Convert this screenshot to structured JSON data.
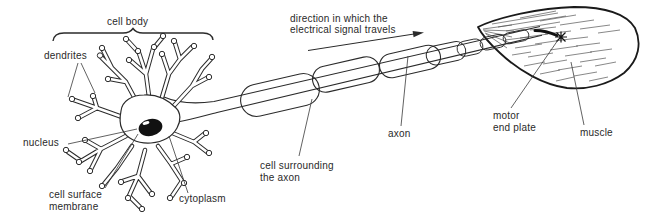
{
  "diagram": {
    "labels": {
      "cell_body": "cell body",
      "dendrites": "dendrites",
      "nucleus": "nucleus",
      "cell_surface_membrane_1": "cell surface",
      "cell_surface_membrane_2": "membrane",
      "cytoplasm": "cytoplasm",
      "signal_direction_1": "direction in which the",
      "signal_direction_2": "electrical signal travels",
      "cell_surrounding_axon_1": "cell surrounding",
      "cell_surrounding_axon_2": "the axon",
      "axon": "axon",
      "motor_end_plate_1": "motor",
      "motor_end_plate_2": "end plate",
      "muscle": "muscle"
    },
    "colors": {
      "ink": "#2b2b2b",
      "leader_line": "#3a3a3a",
      "nucleus_fill": "#111111",
      "muscle_hatch": "#555555",
      "background": "#ffffff"
    }
  }
}
